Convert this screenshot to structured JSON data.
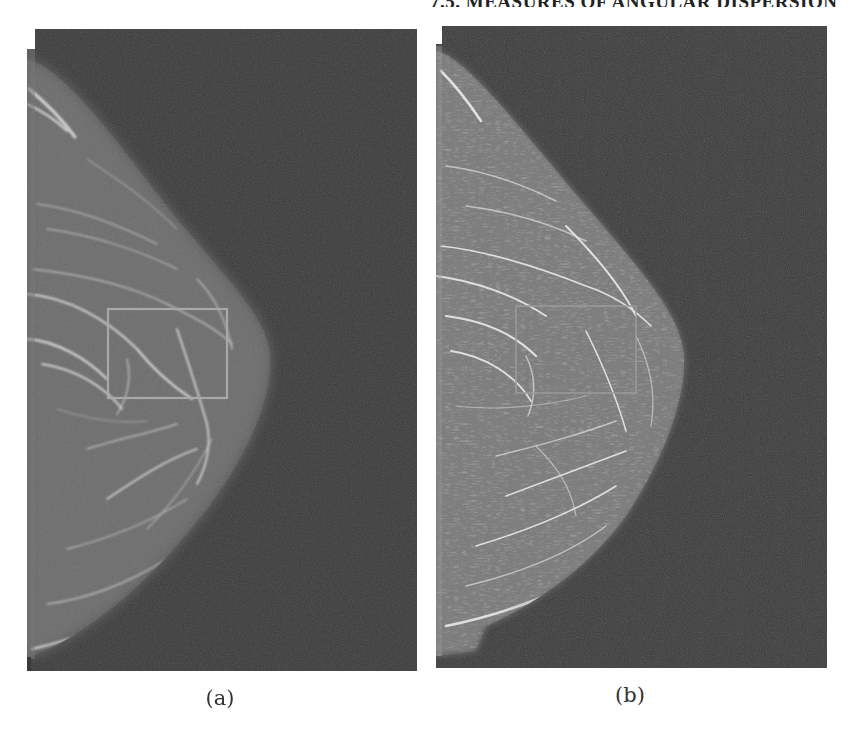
{
  "header": {
    "running_head": "7.5. MEASURES OF ANGULAR DISPERSION"
  },
  "figure": {
    "panels": [
      {
        "id": "a",
        "caption": "(a)",
        "description": "Original mammogram (medio-lateral view) with rectangular region of interest",
        "roi_box": {
          "x": 81,
          "y": 280,
          "width": 119,
          "height": 89
        },
        "background_color": "#3b3b3b",
        "tissue_color": "#6e6e6e",
        "roi_color": "#a8a8a8"
      },
      {
        "id": "b",
        "caption": "(b)",
        "description": "Enhanced mammogram showing oriented fibroglandular texture with the same region of interest",
        "roi_box": {
          "x": 80,
          "y": 280,
          "width": 120,
          "height": 87
        },
        "background_color": "#3b3b3b",
        "tissue_color": "#7d7d7d",
        "roi_color": "#9a9a9a"
      }
    ]
  }
}
